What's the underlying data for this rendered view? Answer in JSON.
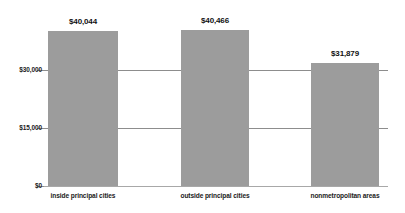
{
  "chart_data": {
    "type": "bar",
    "title": "",
    "subtitle": "",
    "xlabel": "",
    "ylabel": "",
    "categories": [
      "inside principal cities",
      "outside principal cities",
      "nonmetropolitan areas"
    ],
    "values": [
      40044,
      40466,
      31879
    ],
    "data_labels": [
      "$40,044",
      "$40,466",
      "$31,879"
    ],
    "ylim": [
      0,
      45000
    ],
    "yticks": [
      0,
      15000,
      30000
    ],
    "ytick_labels": [
      "$0",
      "$15,000",
      "$30,000"
    ],
    "grid": true,
    "legend": false,
    "legend_position": "none",
    "series": [
      {
        "name": "",
        "values": [
          40044,
          40466,
          31879
        ],
        "color": "#9c9c9c"
      }
    ],
    "bar_color": "#9c9c9c",
    "gridline_color": "#8d8d8d",
    "text_color": "#1b1b1b",
    "background": "#ffffff"
  }
}
